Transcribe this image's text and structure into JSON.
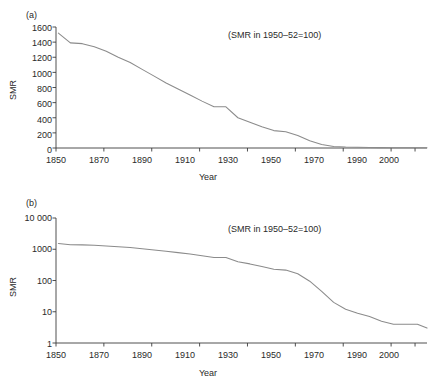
{
  "figure": {
    "background": "#ffffff",
    "line_color": "#8b8b8b",
    "axis_color": "#3c3c3c"
  },
  "panels": [
    {
      "id": "a",
      "label": "(a)",
      "annotation": "(SMR in 1950–52=100)",
      "ylabel": "SMR",
      "xlabel": "Year"
    },
    {
      "id": "b",
      "label": "(b)",
      "annotation": "(SMR in 1950–52=100)",
      "ylabel": "SMR",
      "xlabel": "Year"
    }
  ],
  "chart_data": [
    {
      "type": "line",
      "panel": "(a)",
      "title": "",
      "subtitle": "",
      "annotation": "(SMR in 1950–52=100)",
      "xlabel": "Year",
      "ylabel": "SMR",
      "xlim": [
        1850,
        2005
      ],
      "ylim": [
        0,
        1600
      ],
      "yscale": "linear",
      "grid": false,
      "legend": false,
      "xticks": [
        1850,
        1870,
        1890,
        1910,
        1930,
        1950,
        1970,
        1990,
        2000
      ],
      "xtick_labels": [
        "1850",
        "1870",
        "1890",
        "1910",
        "1930",
        "1950",
        "1970",
        "1990",
        "2000"
      ],
      "yticks": [
        0,
        200,
        400,
        600,
        800,
        1000,
        1200,
        1400,
        1600
      ],
      "ytick_labels": [
        "0",
        "200",
        "400",
        "600",
        "800",
        "1000",
        "1200",
        "1400",
        "1600"
      ],
      "series": [
        {
          "name": "SMR for respiratory tuberculosis",
          "x": [
            1851,
            1856,
            1861,
            1866,
            1871,
            1876,
            1881,
            1886,
            1891,
            1896,
            1901,
            1906,
            1911,
            1916,
            1921,
            1926,
            1931,
            1936,
            1941,
            1946,
            1951,
            1956,
            1961,
            1966,
            1971,
            1976,
            1981,
            1986,
            1991,
            1996,
            2001,
            2005
          ],
          "y": [
            1520,
            1390,
            1380,
            1340,
            1280,
            1200,
            1130,
            1040,
            950,
            860,
            780,
            700,
            620,
            545,
            545,
            400,
            340,
            280,
            230,
            215,
            165,
            95,
            45,
            20,
            12,
            9,
            7,
            5,
            4,
            4,
            4,
            3
          ]
        }
      ]
    },
    {
      "type": "line",
      "panel": "(b)",
      "title": "",
      "subtitle": "",
      "annotation": "(SMR in 1950–52=100)",
      "xlabel": "Year",
      "ylabel": "SMR",
      "xlim": [
        1850,
        2005
      ],
      "ylim": [
        1,
        10000
      ],
      "yscale": "log",
      "grid": false,
      "legend": false,
      "xticks": [
        1850,
        1870,
        1890,
        1910,
        1930,
        1950,
        1970,
        1990,
        2000
      ],
      "xtick_labels": [
        "1850",
        "1870",
        "1890",
        "1910",
        "1930",
        "1950",
        "1970",
        "1990",
        "2000"
      ],
      "yticks": [
        1,
        10,
        100,
        1000,
        10000
      ],
      "ytick_labels": [
        "1",
        "10",
        "100",
        "1000",
        "10 000"
      ],
      "series": [
        {
          "name": "SMR for respiratory tuberculosis (log scale)",
          "x": [
            1851,
            1856,
            1861,
            1866,
            1871,
            1876,
            1881,
            1886,
            1891,
            1896,
            1901,
            1906,
            1911,
            1916,
            1921,
            1926,
            1931,
            1936,
            1941,
            1946,
            1951,
            1956,
            1961,
            1966,
            1971,
            1976,
            1981,
            1986,
            1991,
            1996,
            2001,
            2005
          ],
          "y": [
            1520,
            1390,
            1380,
            1340,
            1280,
            1200,
            1130,
            1040,
            950,
            860,
            780,
            700,
            620,
            545,
            545,
            400,
            340,
            280,
            230,
            215,
            165,
            95,
            45,
            20,
            12,
            9,
            7,
            5,
            4,
            4,
            4,
            3
          ]
        }
      ]
    }
  ]
}
